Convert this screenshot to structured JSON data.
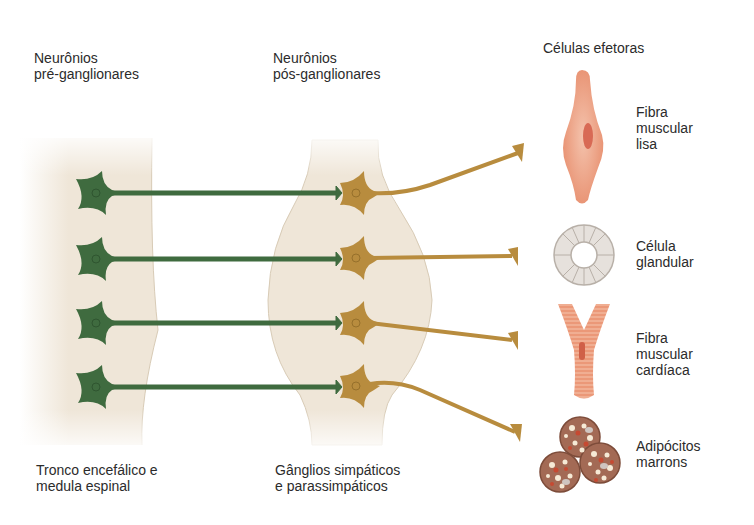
{
  "headers": {
    "preganglionic": [
      "Neurônios",
      "pré-ganglionares"
    ],
    "postganglionic": [
      "Neurônios",
      "pós-ganglionares"
    ],
    "effectors": [
      "Células efetoras"
    ]
  },
  "footers": {
    "cns": [
      "Tronco encefálico e",
      "medula espinal"
    ],
    "ganglia": [
      "Gânglios simpáticos",
      "e parassimpáticos"
    ]
  },
  "effector_cells": [
    {
      "id": "smooth-muscle",
      "label": [
        "Fibra",
        "muscular",
        "lisa"
      ]
    },
    {
      "id": "gland-cell",
      "label": [
        "Célula",
        "glandular"
      ]
    },
    {
      "id": "cardiac-muscle",
      "label": [
        "Fibra",
        "muscular",
        "cardíaca"
      ]
    },
    {
      "id": "brown-adipocytes",
      "label": [
        "Adipócitos",
        "marrons"
      ]
    }
  ],
  "colors": {
    "preganglionic_neuron": "#3f6b3f",
    "postganglionic_neuron": "#b88c3e",
    "tissue_background": "#efe6d8",
    "muscle": "#e99a7a",
    "gland": "#e6e1dc",
    "adipocyte": "#a36a55"
  }
}
